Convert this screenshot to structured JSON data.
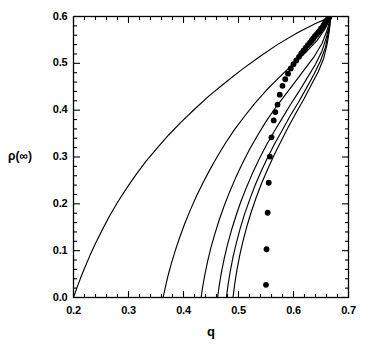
{
  "chart_data": {
    "type": "line",
    "title": "",
    "xlabel": "q",
    "ylabel": "ρ(∞)",
    "xlim": [
      0.2,
      0.7
    ],
    "ylim": [
      0.0,
      0.6
    ],
    "grid": false,
    "legend": "none",
    "x_major_ticks": [
      0.2,
      0.3,
      0.4,
      0.5,
      0.6,
      0.7
    ],
    "x_tick_labels": [
      "0.2",
      "0.3",
      "0.4",
      "0.5",
      "0.6",
      "0.7"
    ],
    "x_minor_step": 0.02,
    "y_major_ticks": [
      0.0,
      0.1,
      0.2,
      0.3,
      0.4,
      0.5,
      0.6
    ],
    "y_tick_labels": [
      "0.0",
      "0.1",
      "0.2",
      "0.3",
      "0.4",
      "0.5",
      "0.6"
    ],
    "y_minor_step": 0.02,
    "series": [
      {
        "name": "curve-1",
        "style": "line",
        "x_intercept": 0.2,
        "points": [
          [
            0.2,
            0.0
          ],
          [
            0.206,
            0.02
          ],
          [
            0.213,
            0.042
          ],
          [
            0.221,
            0.065
          ],
          [
            0.23,
            0.09
          ],
          [
            0.241,
            0.118
          ],
          [
            0.253,
            0.146
          ],
          [
            0.266,
            0.175
          ],
          [
            0.281,
            0.205
          ],
          [
            0.297,
            0.234
          ],
          [
            0.314,
            0.263
          ],
          [
            0.332,
            0.291
          ],
          [
            0.352,
            0.319
          ],
          [
            0.373,
            0.347
          ],
          [
            0.396,
            0.375
          ],
          [
            0.42,
            0.402
          ],
          [
            0.446,
            0.43
          ],
          [
            0.474,
            0.457
          ],
          [
            0.504,
            0.485
          ],
          [
            0.537,
            0.513
          ],
          [
            0.572,
            0.541
          ],
          [
            0.608,
            0.566
          ],
          [
            0.64,
            0.585
          ],
          [
            0.662,
            0.596
          ],
          [
            0.667,
            0.6
          ]
        ]
      },
      {
        "name": "curve-2",
        "style": "line",
        "x_intercept": 0.363,
        "points": [
          [
            0.363,
            0.0
          ],
          [
            0.367,
            0.022
          ],
          [
            0.372,
            0.047
          ],
          [
            0.378,
            0.073
          ],
          [
            0.385,
            0.1
          ],
          [
            0.393,
            0.128
          ],
          [
            0.402,
            0.157
          ],
          [
            0.412,
            0.186
          ],
          [
            0.423,
            0.215
          ],
          [
            0.435,
            0.244
          ],
          [
            0.448,
            0.273
          ],
          [
            0.462,
            0.302
          ],
          [
            0.477,
            0.331
          ],
          [
            0.493,
            0.359
          ],
          [
            0.511,
            0.387
          ],
          [
            0.53,
            0.415
          ],
          [
            0.551,
            0.443
          ],
          [
            0.574,
            0.47
          ],
          [
            0.598,
            0.497
          ],
          [
            0.622,
            0.523
          ],
          [
            0.643,
            0.549
          ],
          [
            0.657,
            0.573
          ],
          [
            0.664,
            0.59
          ],
          [
            0.667,
            0.6
          ]
        ]
      },
      {
        "name": "curve-3",
        "style": "line",
        "x_intercept": 0.432,
        "points": [
          [
            0.432,
            0.0
          ],
          [
            0.435,
            0.024
          ],
          [
            0.439,
            0.05
          ],
          [
            0.444,
            0.078
          ],
          [
            0.45,
            0.107
          ],
          [
            0.457,
            0.136
          ],
          [
            0.465,
            0.166
          ],
          [
            0.474,
            0.196
          ],
          [
            0.484,
            0.226
          ],
          [
            0.495,
            0.256
          ],
          [
            0.507,
            0.286
          ],
          [
            0.52,
            0.316
          ],
          [
            0.534,
            0.345
          ],
          [
            0.549,
            0.374
          ],
          [
            0.566,
            0.403
          ],
          [
            0.584,
            0.431
          ],
          [
            0.602,
            0.459
          ],
          [
            0.62,
            0.487
          ],
          [
            0.638,
            0.515
          ],
          [
            0.652,
            0.543
          ],
          [
            0.661,
            0.57
          ],
          [
            0.665,
            0.588
          ],
          [
            0.667,
            0.6
          ]
        ]
      },
      {
        "name": "curve-4",
        "style": "line",
        "x_intercept": 0.462,
        "points": [
          [
            0.462,
            0.0
          ],
          [
            0.465,
            0.026
          ],
          [
            0.469,
            0.054
          ],
          [
            0.474,
            0.083
          ],
          [
            0.48,
            0.113
          ],
          [
            0.487,
            0.143
          ],
          [
            0.495,
            0.173
          ],
          [
            0.504,
            0.204
          ],
          [
            0.514,
            0.234
          ],
          [
            0.525,
            0.264
          ],
          [
            0.537,
            0.294
          ],
          [
            0.55,
            0.324
          ],
          [
            0.564,
            0.353
          ],
          [
            0.579,
            0.382
          ],
          [
            0.594,
            0.411
          ],
          [
            0.61,
            0.44
          ],
          [
            0.625,
            0.469
          ],
          [
            0.64,
            0.498
          ],
          [
            0.652,
            0.527
          ],
          [
            0.66,
            0.556
          ],
          [
            0.665,
            0.58
          ],
          [
            0.667,
            0.6
          ]
        ]
      },
      {
        "name": "curve-5",
        "style": "line",
        "x_intercept": 0.478,
        "points": [
          [
            0.478,
            0.0
          ],
          [
            0.481,
            0.027
          ],
          [
            0.485,
            0.056
          ],
          [
            0.49,
            0.086
          ],
          [
            0.496,
            0.116
          ],
          [
            0.503,
            0.147
          ],
          [
            0.511,
            0.178
          ],
          [
            0.52,
            0.208
          ],
          [
            0.53,
            0.239
          ],
          [
            0.541,
            0.269
          ],
          [
            0.553,
            0.299
          ],
          [
            0.566,
            0.329
          ],
          [
            0.58,
            0.358
          ],
          [
            0.594,
            0.388
          ],
          [
            0.609,
            0.417
          ],
          [
            0.623,
            0.446
          ],
          [
            0.637,
            0.476
          ],
          [
            0.649,
            0.505
          ],
          [
            0.658,
            0.534
          ],
          [
            0.663,
            0.563
          ],
          [
            0.666,
            0.585
          ],
          [
            0.667,
            0.6
          ]
        ]
      },
      {
        "name": "curve-6",
        "style": "line",
        "x_intercept": 0.49,
        "points": [
          [
            0.49,
            0.0
          ],
          [
            0.493,
            0.028
          ],
          [
            0.497,
            0.058
          ],
          [
            0.502,
            0.089
          ],
          [
            0.508,
            0.12
          ],
          [
            0.515,
            0.151
          ],
          [
            0.523,
            0.182
          ],
          [
            0.532,
            0.213
          ],
          [
            0.542,
            0.244
          ],
          [
            0.553,
            0.274
          ],
          [
            0.565,
            0.305
          ],
          [
            0.578,
            0.335
          ],
          [
            0.591,
            0.365
          ],
          [
            0.605,
            0.395
          ],
          [
            0.619,
            0.424
          ],
          [
            0.632,
            0.453
          ],
          [
            0.645,
            0.482
          ],
          [
            0.655,
            0.511
          ],
          [
            0.661,
            0.54
          ],
          [
            0.665,
            0.568
          ],
          [
            0.667,
            0.588
          ],
          [
            0.667,
            0.6
          ]
        ]
      },
      {
        "name": "data-points",
        "style": "scatter",
        "marker": "filled-circle",
        "points": [
          [
            0.55,
            0.027
          ],
          [
            0.551,
            0.103
          ],
          [
            0.553,
            0.181
          ],
          [
            0.555,
            0.245
          ],
          [
            0.557,
            0.301
          ],
          [
            0.56,
            0.342
          ],
          [
            0.564,
            0.378
          ],
          [
            0.567,
            0.396
          ],
          [
            0.571,
            0.412
          ],
          [
            0.575,
            0.433
          ],
          [
            0.58,
            0.452
          ],
          [
            0.585,
            0.466
          ],
          [
            0.59,
            0.478
          ],
          [
            0.595,
            0.489
          ],
          [
            0.6,
            0.498
          ],
          [
            0.605,
            0.506
          ],
          [
            0.61,
            0.514
          ],
          [
            0.614,
            0.521
          ],
          [
            0.618,
            0.527
          ],
          [
            0.622,
            0.533
          ],
          [
            0.626,
            0.539
          ],
          [
            0.63,
            0.544
          ],
          [
            0.633,
            0.549
          ],
          [
            0.636,
            0.553
          ],
          [
            0.639,
            0.558
          ],
          [
            0.642,
            0.562
          ],
          [
            0.645,
            0.566
          ],
          [
            0.648,
            0.57
          ],
          [
            0.65,
            0.574
          ],
          [
            0.653,
            0.578
          ],
          [
            0.655,
            0.582
          ],
          [
            0.657,
            0.586
          ],
          [
            0.659,
            0.589
          ],
          [
            0.661,
            0.592
          ],
          [
            0.663,
            0.595
          ],
          [
            0.665,
            0.598
          ]
        ]
      }
    ]
  }
}
